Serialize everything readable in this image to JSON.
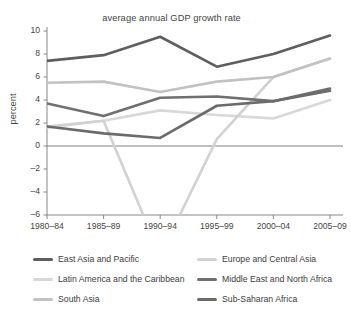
{
  "chart_data": {
    "type": "line",
    "title": "average annual GDP growth rate",
    "xlabel": "",
    "ylabel": "percent",
    "categories": [
      "1980–84",
      "1985–89",
      "1990–94",
      "1995–99",
      "2000–04",
      "2005–09"
    ],
    "ylim": [
      -6,
      10
    ],
    "yticks": [
      -6,
      -4,
      -2,
      0,
      2,
      4,
      6,
      8,
      10
    ],
    "ytick_labels": [
      "–6",
      "–4",
      "–2",
      "0",
      "2",
      "4",
      "6",
      "8",
      "10"
    ],
    "grid": false,
    "legend_position": "bottom",
    "zero_line": true,
    "series": [
      {
        "name": "East Asia and Pacific",
        "color": "#5e5e5e",
        "values": [
          7.4,
          7.9,
          9.5,
          6.9,
          8.0,
          9.6
        ]
      },
      {
        "name": "Europe and Central Asia",
        "color": "#d2d2d2",
        "values": [
          1.7,
          2.2,
          -9.5,
          0.6,
          6.0,
          7.6
        ],
        "note": "1990–94 value falls below the plotted axis minimum of –6"
      },
      {
        "name": "Latin America and the Caribbean",
        "color": "#d8d8d8",
        "values": [
          1.6,
          2.2,
          3.1,
          2.7,
          2.4,
          4.0
        ]
      },
      {
        "name": "Middle East and North Africa",
        "color": "#6f6f6f",
        "values": [
          3.7,
          2.6,
          4.2,
          4.3,
          3.9,
          5.0
        ]
      },
      {
        "name": "South Asia",
        "color": "#c2c2c2",
        "values": [
          5.5,
          5.6,
          4.7,
          5.6,
          6.0,
          7.6
        ]
      },
      {
        "name": "Sub-Saharan Africa",
        "color": "#6b6b6b",
        "values": [
          1.7,
          1.1,
          0.7,
          3.5,
          3.9,
          4.8
        ]
      }
    ]
  },
  "legend": {
    "left_column": [
      "East Asia and Pacific",
      "Latin America and the Caribbean",
      "South Asia"
    ],
    "right_column": [
      "Europe and Central Asia",
      "Middle East and North Africa",
      "Sub-Saharan Africa"
    ]
  },
  "colors": {
    "axis": "#888888",
    "text": "#3d3d3d",
    "background": "#ffffff"
  }
}
